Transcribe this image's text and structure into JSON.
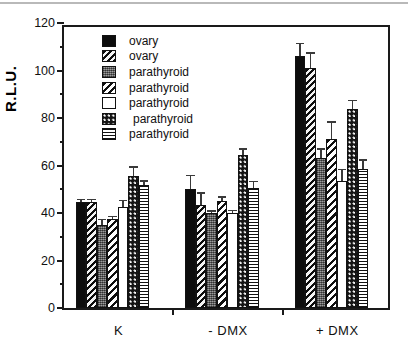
{
  "chart_data": {
    "type": "bar",
    "title": "",
    "xlabel": "",
    "ylabel": "R.L.U.",
    "ylim": [
      0,
      120
    ],
    "ytick_values": [
      0,
      20,
      40,
      60,
      80,
      100,
      120
    ],
    "ytick_labels": [
      "0",
      "20",
      "40",
      "60",
      "80",
      "100",
      "120"
    ],
    "yminor_values": [
      10,
      30,
      50,
      70,
      90,
      110
    ],
    "grid": false,
    "legend_position": "upper-left-inside",
    "categories": [
      "K",
      "- DMX",
      "+ DMX"
    ],
    "series": [
      {
        "name": "ovary",
        "pattern": "solid",
        "values": [
          44.5,
          50.0,
          106.0
        ],
        "errors": [
          0.8,
          5.5,
          5.0
        ]
      },
      {
        "name": "ovary",
        "pattern": "diag",
        "values": [
          44.5,
          43.5,
          101.0
        ],
        "errors": [
          0.8,
          4.5,
          6.0
        ]
      },
      {
        "name": "parathyroid",
        "pattern": "gray",
        "values": [
          35.0,
          40.0,
          63.0
        ],
        "errors": [
          2.0,
          0.6,
          3.5
        ]
      },
      {
        "name": "parathyroid",
        "pattern": "diag2",
        "values": [
          37.5,
          45.0,
          71.0
        ],
        "errors": [
          0.7,
          1.5,
          7.0
        ]
      },
      {
        "name": "parathyroid",
        "pattern": "white",
        "values": [
          42.5,
          40.0,
          53.5
        ],
        "errors": [
          2.5,
          0.8,
          4.5
        ]
      },
      {
        "name": "parathyroid",
        "pattern": "dots",
        "values": [
          55.5,
          64.5,
          84.0
        ],
        "errors": [
          3.5,
          2.0,
          3.0
        ]
      },
      {
        "name": "parathyroid",
        "pattern": "horiz",
        "values": [
          52.0,
          50.5,
          58.5
        ],
        "errors": [
          1.2,
          2.5,
          3.5
        ]
      }
    ]
  },
  "figure": {
    "caption": ""
  }
}
